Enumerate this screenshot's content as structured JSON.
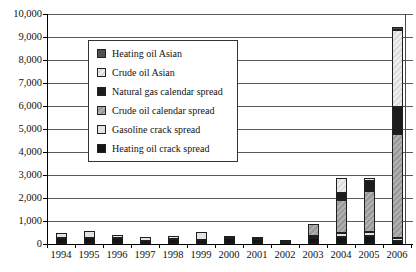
{
  "figure": {
    "background": "#ffffff",
    "gridline_color": "#5a5a5a",
    "axis_color": "#000000",
    "legend_border_color": "#333333"
  },
  "y_axis": {
    "tick_labels": [
      "0",
      "1,000",
      "2,000",
      "3,000",
      "4,000",
      "5,000",
      "6,000",
      "7,000",
      "8,000",
      "9,000",
      "10,000"
    ],
    "min": 0,
    "max": 10000,
    "step": 1000
  },
  "x_axis": {
    "categories": [
      "1994",
      "1995",
      "1996",
      "1997",
      "1998",
      "1999",
      "2000",
      "2001",
      "2002",
      "2003",
      "2004",
      "2005",
      "2006"
    ]
  },
  "chart_data": {
    "type": "bar",
    "stacked": true,
    "title": "",
    "xlabel": "",
    "ylabel": "",
    "ylim": [
      0,
      10000
    ],
    "grid": true,
    "legend_position": "upper-left-inside",
    "categories": [
      "1994",
      "1995",
      "1996",
      "1997",
      "1998",
      "1999",
      "2000",
      "2001",
      "2002",
      "2003",
      "2004",
      "2005",
      "2006"
    ],
    "series": [
      {
        "name": "Heating oil crack spread",
        "color": "#141414",
        "values": [
          250,
          250,
          250,
          150,
          230,
          190,
          250,
          230,
          80,
          250,
          300,
          350,
          150
        ]
      },
      {
        "name": "Gasoline crack spread",
        "color": "#e4e4e4",
        "values": [
          220,
          330,
          150,
          150,
          130,
          330,
          70,
          40,
          30,
          100,
          170,
          190,
          100
        ]
      },
      {
        "name": "Crude oil calendar spread",
        "color": "#b0b0b0",
        "color2": "#989898",
        "values": [
          0,
          0,
          0,
          0,
          0,
          0,
          0,
          0,
          0,
          500,
          1430,
          1750,
          4550
        ]
      },
      {
        "name": "Natural gas calendar spread",
        "color": "#1c1c1c",
        "values": [
          0,
          0,
          0,
          0,
          0,
          0,
          0,
          0,
          0,
          0,
          310,
          450,
          1150
        ]
      },
      {
        "name": "Crude oil Asian",
        "color": "#eeeeee",
        "color2": "#dbdbdb",
        "values": [
          0,
          0,
          0,
          0,
          0,
          0,
          0,
          0,
          0,
          0,
          680,
          150,
          3350
        ]
      },
      {
        "name": "Heating oil Asian",
        "color": "#4f4f4f",
        "values": [
          0,
          0,
          0,
          0,
          0,
          0,
          0,
          0,
          0,
          0,
          0,
          0,
          150
        ]
      }
    ]
  }
}
